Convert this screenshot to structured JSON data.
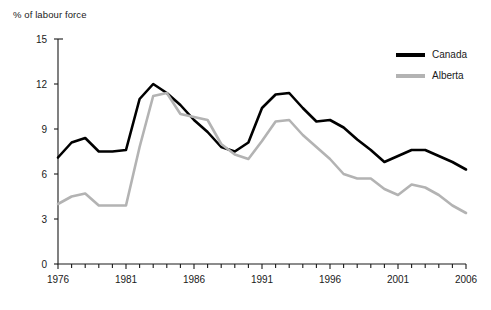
{
  "chart_data": {
    "type": "line",
    "title": "",
    "ylabel": "% of labour force",
    "xlabel": "",
    "ylim": [
      0,
      15
    ],
    "xlim": [
      1976,
      2006
    ],
    "yticks": [
      0,
      3,
      6,
      9,
      12,
      15
    ],
    "ytick_labels": [
      "0",
      "3",
      "6",
      "9",
      "12",
      "15"
    ],
    "xticks": [
      1976,
      1981,
      1986,
      1991,
      1996,
      2001,
      2006
    ],
    "xtick_labels": [
      "1976",
      "1981",
      "1986",
      "1991",
      "1996",
      "2001",
      "2006"
    ],
    "x": [
      1976,
      1977,
      1978,
      1979,
      1980,
      1981,
      1982,
      1983,
      1984,
      1985,
      1986,
      1987,
      1988,
      1989,
      1990,
      1991,
      1992,
      1993,
      1994,
      1995,
      1996,
      1997,
      1998,
      1999,
      2000,
      2001,
      2002,
      2003,
      2004,
      2005,
      2006
    ],
    "grid": false,
    "legend_position": "top-right",
    "series": [
      {
        "name": "Canada",
        "color": "#000000",
        "values": [
          7.1,
          8.1,
          8.4,
          7.5,
          7.5,
          7.6,
          11.0,
          12.0,
          11.4,
          10.6,
          9.6,
          8.8,
          7.8,
          7.5,
          8.1,
          10.4,
          11.3,
          11.4,
          10.4,
          9.5,
          9.6,
          9.1,
          8.3,
          7.6,
          6.8,
          7.2,
          7.6,
          7.6,
          7.2,
          6.8,
          6.3
        ],
        "style": "solid",
        "width": 2.6
      },
      {
        "name": "Alberta",
        "color": "#b3b3b3",
        "values": [
          4.0,
          4.5,
          4.7,
          3.9,
          3.9,
          3.9,
          7.8,
          11.2,
          11.4,
          10.0,
          9.8,
          9.6,
          8.0,
          7.3,
          7.0,
          8.2,
          9.5,
          9.6,
          8.6,
          7.8,
          7.0,
          6.0,
          5.7,
          5.7,
          5.0,
          4.6,
          5.3,
          5.1,
          4.6,
          3.9,
          3.4
        ],
        "style": "solid",
        "width": 2.6
      }
    ]
  },
  "legend": {
    "items": [
      {
        "label": "Canada",
        "color": "#000000"
      },
      {
        "label": "Alberta",
        "color": "#b3b3b3"
      }
    ]
  },
  "axes": {
    "y_axis_title": "% of labour force"
  }
}
